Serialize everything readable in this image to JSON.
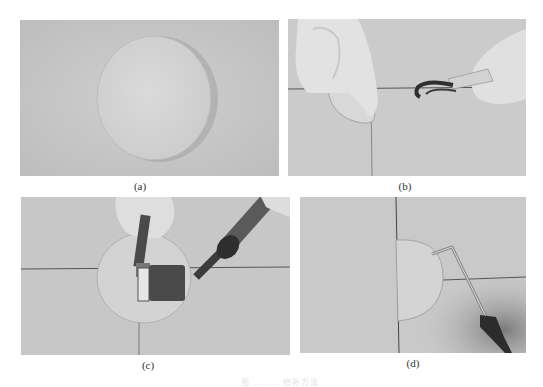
{
  "figure": {
    "panels": [
      {
        "id": "a",
        "label": "(a)",
        "description": "Circular patch laid on flat grey membrane surface"
      },
      {
        "id": "b",
        "label": "(b)",
        "description": "Gloved hands lifting patch edge while hot-air welding nozzle is applied along seam"
      },
      {
        "id": "c",
        "label": "(c)",
        "description": "Pressing welded patch with a hand roller beside hot-air gun over cross seam"
      },
      {
        "id": "d",
        "label": "(d)",
        "description": "Checking patch edge seam with a bent metal probe"
      }
    ],
    "caption": "图 ……… 修补方法",
    "colors": {
      "background": "#ffffff",
      "membrane": "#c9c9c9",
      "patch": "#d6d6d6",
      "seam": "#555555",
      "glove": "#e4e4e4",
      "tool_dark": "#3a3a3a"
    }
  }
}
